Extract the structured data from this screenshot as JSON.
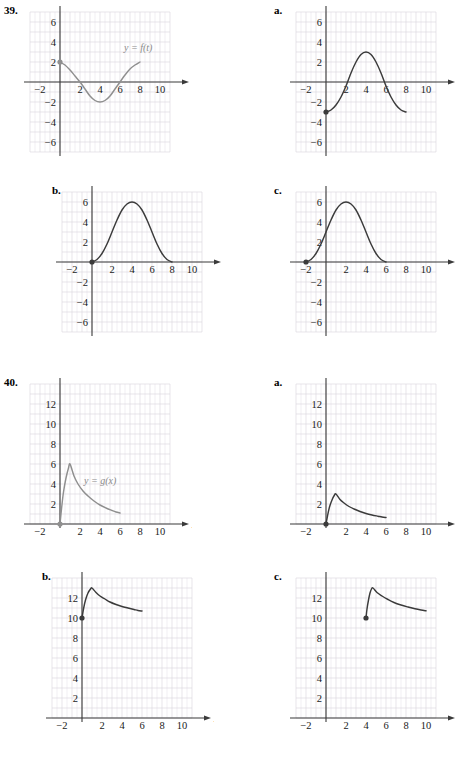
{
  "page": {
    "background": "#ffffff",
    "grid_color": "#d9d4dc",
    "axis_color": "#3a3a3a",
    "curve_color_dark": "#3b3b3b",
    "curve_color_gray": "#8f8f8f"
  },
  "problems": [
    {
      "number": "39.",
      "main": {
        "panel_label": "39.",
        "y_axis_label": "y",
        "x_axis_label": "t",
        "curve_label": "y = f(t)",
        "x_ticks": [
          "-2",
          "2",
          "4",
          "6",
          "8",
          "10"
        ],
        "y_ticks": [
          "6",
          "4",
          "2",
          "-2",
          "-4",
          "-6"
        ],
        "chart_data": {
          "type": "line",
          "title": "y = f(t)",
          "xlabel": "t",
          "ylabel": "y",
          "xlim": [
            -3,
            11
          ],
          "ylim": [
            -7,
            7
          ],
          "grid": true,
          "color": "#8f8f8f",
          "endpoint_dot": [
            0,
            2
          ],
          "x": [
            0,
            0.5,
            1,
            1.5,
            2,
            2.5,
            3,
            3.5,
            4,
            4.5,
            5,
            5.5,
            6,
            6.5,
            7,
            7.5,
            8
          ],
          "y": [
            2,
            1.7,
            1.2,
            0.6,
            0.0,
            -0.7,
            -1.4,
            -1.85,
            -2.0,
            -1.85,
            -1.4,
            -0.7,
            0.0,
            0.7,
            1.3,
            1.7,
            2.0
          ]
        }
      },
      "options": [
        {
          "panel_label": "a.",
          "y_axis_label": "y",
          "x_axis_label": "",
          "x_ticks": [
            "-2",
            "2",
            "4",
            "6",
            "8",
            "10"
          ],
          "y_ticks": [
            "6",
            "4",
            "2",
            "-2",
            "-4",
            "-6"
          ],
          "chart_data": {
            "type": "line",
            "title": "",
            "xlabel": "",
            "ylabel": "y",
            "xlim": [
              -3,
              11
            ],
            "ylim": [
              -7,
              7
            ],
            "grid": true,
            "color": "#3b3b3b",
            "endpoint_dot": [
              0,
              -3
            ],
            "x": [
              0,
              0.5,
              1,
              1.5,
              2,
              2.5,
              3,
              3.5,
              4,
              4.5,
              5,
              5.5,
              6,
              6.5,
              7,
              7.5,
              8
            ],
            "y": [
              -3.0,
              -2.8,
              -2.3,
              -1.5,
              -0.4,
              0.9,
              2.0,
              2.75,
              3.0,
              2.75,
              2.0,
              0.9,
              -0.4,
              -1.5,
              -2.3,
              -2.8,
              -3.0
            ]
          }
        },
        {
          "panel_label": "b.",
          "y_axis_label": "y",
          "x_axis_label": "t",
          "x_ticks": [
            "-2",
            "2",
            "4",
            "6",
            "8",
            "10"
          ],
          "y_ticks": [
            "6",
            "4",
            "2",
            "-2",
            "-4",
            "-6"
          ],
          "chart_data": {
            "type": "line",
            "title": "",
            "xlabel": "t",
            "ylabel": "y",
            "xlim": [
              -3,
              11
            ],
            "ylim": [
              -7,
              7
            ],
            "grid": true,
            "color": "#3b3b3b",
            "endpoint_dot": [
              0,
              0
            ],
            "x": [
              0,
              0.5,
              1,
              1.5,
              2,
              2.5,
              3,
              3.5,
              4,
              4.5,
              5,
              5.5,
              6,
              6.5,
              7,
              7.5,
              8
            ],
            "y": [
              0.0,
              0.25,
              0.85,
              1.8,
              3.0,
              4.2,
              5.2,
              5.8,
              6.0,
              5.8,
              5.2,
              4.2,
              3.0,
              1.8,
              0.85,
              0.25,
              0.0
            ]
          }
        },
        {
          "panel_label": "c.",
          "y_axis_label": "y",
          "x_axis_label": "",
          "x_ticks": [
            "-2",
            "2",
            "4",
            "6",
            "8",
            "10"
          ],
          "y_ticks": [
            "6",
            "4",
            "2",
            "-2",
            "-4",
            "-6"
          ],
          "chart_data": {
            "type": "line",
            "title": "",
            "xlabel": "",
            "ylabel": "y",
            "xlim": [
              -3,
              11
            ],
            "ylim": [
              -7,
              7
            ],
            "grid": true,
            "color": "#3b3b3b",
            "endpoint_dot": [
              -2,
              0
            ],
            "x": [
              -2,
              -1.5,
              -1,
              -0.5,
              0,
              0.5,
              1,
              1.5,
              2,
              2.5,
              3,
              3.5,
              4,
              4.5,
              5,
              5.5,
              6
            ],
            "y": [
              0.0,
              0.25,
              0.85,
              1.8,
              3.0,
              4.2,
              5.2,
              5.8,
              6.0,
              5.8,
              5.2,
              4.2,
              3.0,
              1.8,
              0.85,
              0.25,
              0.0
            ]
          }
        }
      ]
    },
    {
      "number": "40.",
      "main": {
        "panel_label": "40.",
        "y_axis_label": "y",
        "x_axis_label": "x",
        "curve_label": "y = g(x)",
        "x_ticks": [
          "-2",
          "2",
          "4",
          "6",
          "8",
          "10"
        ],
        "y_ticks": [
          "12",
          "10",
          "8",
          "6",
          "4",
          "2"
        ],
        "chart_data": {
          "type": "line",
          "title": "y = g(x)",
          "xlabel": "x",
          "ylabel": "y",
          "xlim": [
            -3,
            11
          ],
          "ylim": [
            0,
            14
          ],
          "grid": true,
          "color": "#8f8f8f",
          "endpoint_dot": [
            0,
            0
          ],
          "x": [
            0,
            0.15,
            0.35,
            0.6,
            0.85,
            1.0,
            1.4,
            1.8,
            2.3,
            2.8,
            3.4,
            4.0,
            4.6,
            5.2,
            5.6,
            6.0
          ],
          "y": [
            0.0,
            1.5,
            3.2,
            4.6,
            5.6,
            6.0,
            4.8,
            4.0,
            3.3,
            2.8,
            2.3,
            1.9,
            1.6,
            1.35,
            1.2,
            1.1
          ]
        }
      },
      "options": [
        {
          "panel_label": "a.",
          "y_axis_label": "y",
          "x_axis_label": "",
          "x_ticks": [
            "-2",
            "2",
            "4",
            "6",
            "8",
            "10"
          ],
          "y_ticks": [
            "12",
            "10",
            "8",
            "6",
            "4",
            "2"
          ],
          "chart_data": {
            "type": "line",
            "title": "",
            "xlabel": "",
            "ylabel": "y",
            "xlim": [
              -3,
              11
            ],
            "ylim": [
              0,
              14
            ],
            "grid": true,
            "color": "#3b3b3b",
            "endpoint_dot": [
              0,
              0
            ],
            "x": [
              0,
              0.15,
              0.35,
              0.6,
              0.85,
              1.0,
              1.4,
              1.8,
              2.3,
              2.8,
              3.4,
              4.0,
              4.6,
              5.2,
              5.6,
              6.0
            ],
            "y": [
              0.0,
              0.8,
              1.7,
              2.4,
              2.9,
              3.0,
              2.45,
              2.1,
              1.75,
              1.5,
              1.25,
              1.05,
              0.9,
              0.78,
              0.7,
              0.65
            ]
          }
        },
        {
          "panel_label": "b.",
          "y_axis_label": "y",
          "x_axis_label": "x",
          "x_ticks": [
            "-2",
            "2",
            "4",
            "6",
            "8",
            "10"
          ],
          "y_ticks": [
            "12",
            "10",
            "8",
            "6",
            "4",
            "2"
          ],
          "chart_data": {
            "type": "line",
            "title": "",
            "xlabel": "x",
            "ylabel": "y",
            "xlim": [
              -3,
              11
            ],
            "ylim": [
              0,
              14
            ],
            "grid": true,
            "color": "#3b3b3b",
            "endpoint_dot": [
              0,
              10
            ],
            "x": [
              0,
              0.15,
              0.35,
              0.6,
              0.85,
              1.0,
              1.4,
              1.8,
              2.3,
              2.8,
              3.4,
              4.0,
              4.6,
              5.2,
              5.6,
              6.0
            ],
            "y": [
              10.0,
              10.9,
              11.8,
              12.5,
              12.9,
              13.0,
              12.55,
              12.2,
              11.9,
              11.6,
              11.35,
              11.15,
              11.0,
              10.85,
              10.75,
              10.7
            ]
          }
        },
        {
          "panel_label": "c.",
          "y_axis_label": "y",
          "x_axis_label": "",
          "x_ticks": [
            "-2",
            "2",
            "4",
            "6",
            "8",
            "10"
          ],
          "y_ticks": [
            "12",
            "10",
            "8",
            "6",
            "4",
            "2"
          ],
          "chart_data": {
            "type": "line",
            "title": "",
            "xlabel": "",
            "ylabel": "y",
            "xlim": [
              -3,
              11
            ],
            "ylim": [
              0,
              14
            ],
            "grid": true,
            "color": "#3b3b3b",
            "endpoint_dot": [
              4,
              10
            ],
            "x": [
              4.0,
              4.1,
              4.25,
              4.4,
              4.55,
              4.7,
              5.1,
              5.6,
              6.2,
              6.8,
              7.5,
              8.2,
              8.9,
              9.5,
              10.0
            ],
            "y": [
              10.0,
              10.9,
              11.8,
              12.5,
              12.9,
              13.0,
              12.55,
              12.2,
              11.85,
              11.55,
              11.3,
              11.1,
              10.92,
              10.8,
              10.72
            ]
          }
        }
      ]
    }
  ]
}
